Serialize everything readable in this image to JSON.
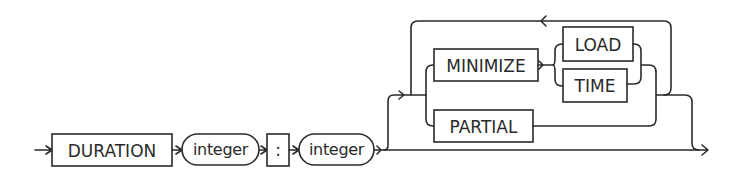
{
  "diagram": {
    "type": "railroad-syntax-diagram",
    "stroke_color": "#2a2a2a",
    "background": "#ffffff",
    "terminals": {
      "duration": "DURATION",
      "colon": ":",
      "minimize": "MINIMIZE",
      "load": "LOAD",
      "time": "TIME",
      "partial": "PARTIAL"
    },
    "nonterminals": {
      "integer_1": "integer",
      "integer_2": "integer"
    },
    "sequence": [
      "DURATION",
      "integer",
      ":",
      "integer",
      "[ { MINIMIZE (LOAD | TIME) | PARTIAL } ... ]"
    ]
  }
}
